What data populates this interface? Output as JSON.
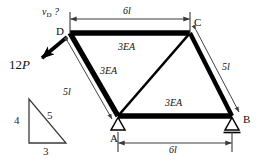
{
  "figure": {
    "type": "truss-free-body-diagram",
    "stroke_color": "#000000",
    "dim_color": "#3a3a3a",
    "thin_color": "#555555"
  },
  "query": {
    "label": "v",
    "subscript": "D",
    "suffix": " ?",
    "full": "vD ?"
  },
  "load": {
    "label_prefix": "12",
    "label_symbol": "P",
    "full": "12P",
    "direction": "down-left",
    "applied_at": "D"
  },
  "nodes": [
    {
      "id": "A",
      "label": "A",
      "x": 118,
      "y": 116,
      "support": "pin"
    },
    {
      "id": "B",
      "label": "B",
      "x": 232,
      "y": 116,
      "support": "roller"
    },
    {
      "id": "C",
      "label": "C",
      "x": 190,
      "y": 33,
      "support": "none"
    },
    {
      "id": "D",
      "label": "D",
      "x": 70,
      "y": 33,
      "support": "none"
    }
  ],
  "members": [
    {
      "id": "DC",
      "from": "D",
      "to": "C",
      "weight": "thick",
      "label": "3EA"
    },
    {
      "id": "DA",
      "from": "D",
      "to": "A",
      "weight": "thick",
      "label": "3EA"
    },
    {
      "id": "AC",
      "from": "A",
      "to": "C",
      "weight": "medium",
      "label": ""
    },
    {
      "id": "CB",
      "from": "C",
      "to": "B",
      "weight": "thick",
      "label": ""
    },
    {
      "id": "AB",
      "from": "A",
      "to": "B",
      "weight": "thick",
      "label": "3EA"
    }
  ],
  "member_labels": [
    {
      "text": "3EA",
      "for": "DC"
    },
    {
      "text": "3EA",
      "for": "DA"
    },
    {
      "text": "3EA",
      "for": "AB"
    }
  ],
  "dimensions": [
    {
      "id": "top",
      "text": "6l",
      "from": "D",
      "to": "C",
      "orientation": "horizontal"
    },
    {
      "id": "bottom",
      "text": "6l",
      "from": "A",
      "to": "B",
      "orientation": "horizontal"
    },
    {
      "id": "left",
      "text": "5l",
      "for": "DA",
      "orientation": "diagonal"
    },
    {
      "id": "right",
      "text": "5l",
      "for": "CB",
      "orientation": "diagonal"
    }
  ],
  "slope_triangle": {
    "vertical": "4",
    "hypotenuse": "5",
    "horizontal": "3"
  }
}
